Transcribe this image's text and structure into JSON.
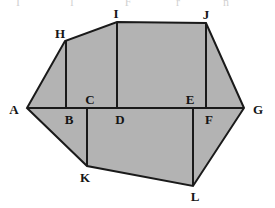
{
  "figure": {
    "kind": "geometry-diagram",
    "width": 275,
    "height": 208,
    "background_color": "#ffffff",
    "fill_color": "#b3b3b3",
    "stroke_color": "#1a1a1a",
    "stroke_width": 2,
    "inner_stroke_width": 2,
    "label_color": "#151515"
  },
  "outline": {
    "name": "outer-polygon",
    "order": [
      "A",
      "H",
      "I",
      "J",
      "G",
      "L",
      "K"
    ],
    "points": "27,108 65,41 117,22 206,23 244,108 193,186 87,166"
  },
  "segments": [
    {
      "name": "segment-AG",
      "label": "AG",
      "from": "A",
      "to": "G",
      "x1": 27,
      "y1": 108,
      "x2": 244,
      "y2": 108
    },
    {
      "name": "segment-HB",
      "label": "HB",
      "from": "H",
      "to": "B",
      "x1": 66,
      "y1": 41,
      "x2": 66,
      "y2": 108
    },
    {
      "name": "segment-ID",
      "label": "ID",
      "from": "I",
      "to": "D",
      "x1": 117,
      "y1": 22,
      "x2": 117,
      "y2": 108
    },
    {
      "name": "segment-JF",
      "label": "JF",
      "from": "J",
      "to": "F",
      "x1": 206,
      "y1": 23,
      "x2": 206,
      "y2": 108
    },
    {
      "name": "segment-CK",
      "label": "CK",
      "from": "C",
      "to": "K",
      "x1": 87,
      "y1": 108,
      "x2": 87,
      "y2": 166
    },
    {
      "name": "segment-EL",
      "label": "EL",
      "from": "E",
      "to": "L",
      "x1": 193,
      "y1": 108,
      "x2": 193,
      "y2": 186
    }
  ],
  "vertices": [
    {
      "name": "vertex-label-A",
      "label": "A",
      "point_x": 27,
      "point_y": 108,
      "label_x": 14,
      "label_y": 109
    },
    {
      "name": "vertex-label-B",
      "label": "B",
      "point_x": 66,
      "point_y": 108,
      "label_x": 69,
      "label_y": 119
    },
    {
      "name": "vertex-label-C",
      "label": "C",
      "point_x": 87,
      "point_y": 108,
      "label_x": 90,
      "label_y": 99
    },
    {
      "name": "vertex-label-D",
      "label": "D",
      "point_x": 117,
      "point_y": 108,
      "label_x": 120,
      "label_y": 119
    },
    {
      "name": "vertex-label-E",
      "label": "E",
      "point_x": 193,
      "point_y": 108,
      "label_x": 190,
      "label_y": 99
    },
    {
      "name": "vertex-label-F",
      "label": "F",
      "point_x": 206,
      "point_y": 108,
      "label_x": 209,
      "label_y": 119
    },
    {
      "name": "vertex-label-G",
      "label": "G",
      "point_x": 244,
      "point_y": 108,
      "label_x": 258,
      "label_y": 109
    },
    {
      "name": "vertex-label-H",
      "label": "H",
      "point_x": 65,
      "point_y": 41,
      "label_x": 60,
      "label_y": 33
    },
    {
      "name": "vertex-label-I",
      "label": "I",
      "point_x": 117,
      "point_y": 22,
      "label_x": 116,
      "label_y": 13
    },
    {
      "name": "vertex-label-J",
      "label": "J",
      "point_x": 206,
      "point_y": 23,
      "label_x": 206,
      "label_y": 14
    },
    {
      "name": "vertex-label-K",
      "label": "K",
      "point_x": 87,
      "point_y": 166,
      "label_x": 85,
      "label_y": 177
    },
    {
      "name": "vertex-label-L",
      "label": "L",
      "point_x": 193,
      "point_y": 186,
      "label_x": 195,
      "label_y": 196
    }
  ],
  "top_artifacts": [
    {
      "name": "artifact-glyph-1",
      "text": "I",
      "x": 18,
      "y": -5
    },
    {
      "name": "artifact-glyph-2",
      "text": "l",
      "x": 72,
      "y": -5
    },
    {
      "name": "artifact-glyph-3",
      "text": "F",
      "x": 128,
      "y": -5
    },
    {
      "name": "artifact-glyph-4",
      "text": "r",
      "x": 178,
      "y": -5
    },
    {
      "name": "artifact-glyph-5",
      "text": "n",
      "x": 226,
      "y": -5
    }
  ]
}
